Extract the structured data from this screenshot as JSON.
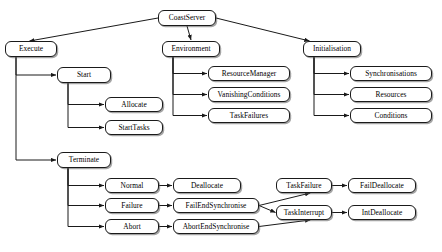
{
  "diagram": {
    "type": "tree-diagram",
    "style": {
      "node_fill": "#ffffff",
      "node_border": "#1a1a1a",
      "edge_color": "#1a1a1a",
      "text_color": "#000000",
      "background": "#ffffff"
    },
    "nodes": [
      {
        "id": "coastserver",
        "label": "CoastServer",
        "x": 158,
        "y": 10,
        "w": 58,
        "h": 16
      },
      {
        "id": "execute",
        "label": "Execute",
        "x": 5,
        "y": 41,
        "w": 52,
        "h": 16
      },
      {
        "id": "environment",
        "label": "Environment",
        "x": 162,
        "y": 41,
        "w": 58,
        "h": 16
      },
      {
        "id": "initialisation",
        "label": "Initialisation",
        "x": 303,
        "y": 41,
        "w": 58,
        "h": 16
      },
      {
        "id": "start",
        "label": "Start",
        "x": 57,
        "y": 67,
        "w": 54,
        "h": 16
      },
      {
        "id": "resourcemanager",
        "label": "ResourceManager",
        "x": 208,
        "y": 66,
        "w": 82,
        "h": 15
      },
      {
        "id": "synchronisations",
        "label": "Synchronisations",
        "x": 350,
        "y": 66,
        "w": 82,
        "h": 15
      },
      {
        "id": "vanishingconditions",
        "label": "VanishingConditions",
        "x": 208,
        "y": 87,
        "w": 82,
        "h": 15
      },
      {
        "id": "resources",
        "label": "Resources",
        "x": 350,
        "y": 87,
        "w": 82,
        "h": 15
      },
      {
        "id": "allocate",
        "label": "Allocate",
        "x": 105,
        "y": 97,
        "w": 58,
        "h": 15
      },
      {
        "id": "taskfailures",
        "label": "TaskFailures",
        "x": 208,
        "y": 108,
        "w": 82,
        "h": 15
      },
      {
        "id": "conditions",
        "label": "Conditions",
        "x": 350,
        "y": 108,
        "w": 82,
        "h": 15
      },
      {
        "id": "starttasks",
        "label": "StartTasks",
        "x": 105,
        "y": 120,
        "w": 58,
        "h": 15
      },
      {
        "id": "terminate",
        "label": "Terminate",
        "x": 57,
        "y": 152,
        "w": 54,
        "h": 16
      },
      {
        "id": "normal",
        "label": "Normal",
        "x": 105,
        "y": 178,
        "w": 54,
        "h": 15
      },
      {
        "id": "deallocate",
        "label": "Deallocate",
        "x": 173,
        "y": 178,
        "w": 68,
        "h": 15
      },
      {
        "id": "taskfailure",
        "label": "TaskFailure",
        "x": 276,
        "y": 178,
        "w": 56,
        "h": 15
      },
      {
        "id": "faildeallocate",
        "label": "FailDeallocate",
        "x": 348,
        "y": 178,
        "w": 68,
        "h": 15
      },
      {
        "id": "failure",
        "label": "Failure",
        "x": 105,
        "y": 198,
        "w": 54,
        "h": 15
      },
      {
        "id": "failendsynchronise",
        "label": "FailEndSynchronise",
        "x": 173,
        "y": 198,
        "w": 86,
        "h": 15
      },
      {
        "id": "taskinterrupt",
        "label": "TaskInterrupt",
        "x": 276,
        "y": 205,
        "w": 56,
        "h": 15
      },
      {
        "id": "intdeallocate",
        "label": "IntDeallocate",
        "x": 348,
        "y": 205,
        "w": 68,
        "h": 15
      },
      {
        "id": "abort",
        "label": "Abort",
        "x": 105,
        "y": 219,
        "w": 54,
        "h": 15
      },
      {
        "id": "abortendsynchronise",
        "label": "AbortEndSynchronise",
        "x": 173,
        "y": 219,
        "w": 86,
        "h": 15
      }
    ],
    "edges": [
      {
        "from": "coastserver",
        "to": "execute",
        "kind": "diagonal"
      },
      {
        "from": "coastserver",
        "to": "environment",
        "kind": "vertical"
      },
      {
        "from": "coastserver",
        "to": "initialisation",
        "kind": "diagonal"
      },
      {
        "from": "execute",
        "to": "start",
        "kind": "elbow"
      },
      {
        "from": "execute",
        "to": "terminate",
        "kind": "elbow"
      },
      {
        "from": "start",
        "to": "allocate",
        "kind": "elbow"
      },
      {
        "from": "start",
        "to": "starttasks",
        "kind": "elbow"
      },
      {
        "from": "environment",
        "to": "resourcemanager",
        "kind": "elbow"
      },
      {
        "from": "environment",
        "to": "vanishingconditions",
        "kind": "elbow"
      },
      {
        "from": "environment",
        "to": "taskfailures",
        "kind": "elbow"
      },
      {
        "from": "initialisation",
        "to": "synchronisations",
        "kind": "elbow"
      },
      {
        "from": "initialisation",
        "to": "resources",
        "kind": "elbow"
      },
      {
        "from": "initialisation",
        "to": "conditions",
        "kind": "elbow"
      },
      {
        "from": "terminate",
        "to": "normal",
        "kind": "elbow"
      },
      {
        "from": "terminate",
        "to": "failure",
        "kind": "elbow"
      },
      {
        "from": "terminate",
        "to": "abort",
        "kind": "elbow"
      },
      {
        "from": "normal",
        "to": "deallocate",
        "kind": "straight"
      },
      {
        "from": "failure",
        "to": "failendsynchronise",
        "kind": "straight"
      },
      {
        "from": "abort",
        "to": "abortendsynchronise",
        "kind": "straight"
      },
      {
        "from": "failendsynchronise",
        "to": "taskfailure",
        "kind": "diagonal"
      },
      {
        "from": "failendsynchronise",
        "to": "taskinterrupt",
        "kind": "diagonal"
      },
      {
        "from": "abortendsynchronise",
        "to": "taskinterrupt",
        "kind": "diagonal"
      },
      {
        "from": "taskfailure",
        "to": "faildeallocate",
        "kind": "straight"
      },
      {
        "from": "taskinterrupt",
        "to": "intdeallocate",
        "kind": "straight"
      }
    ]
  }
}
